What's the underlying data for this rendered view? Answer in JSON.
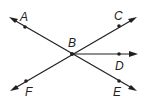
{
  "diagram": {
    "type": "geometry-rays",
    "vertex": {
      "name": "B",
      "label": "B",
      "x": 72,
      "y": 54
    },
    "points": [
      {
        "name": "A",
        "label": "A",
        "x": 25,
        "y": 27,
        "label_x": 21,
        "label_y": 21
      },
      {
        "name": "C",
        "label": "C",
        "x": 119,
        "y": 26,
        "label_x": 115,
        "label_y": 20
      },
      {
        "name": "D",
        "label": "D",
        "x": 119,
        "y": 54,
        "label_x": 115,
        "label_y": 70
      },
      {
        "name": "E",
        "label": "E",
        "x": 119,
        "y": 81,
        "label_x": 113,
        "label_y": 96
      },
      {
        "name": "F",
        "label": "F",
        "x": 26,
        "y": 81,
        "label_x": 25,
        "label_y": 96
      }
    ],
    "lines": [
      {
        "name": "line-AE",
        "through": [
          "A",
          "B",
          "E"
        ],
        "from": [
          9,
          17
        ],
        "to": [
          137,
          91
        ],
        "arrows": "both"
      },
      {
        "name": "line-FC",
        "through": [
          "F",
          "B",
          "C"
        ],
        "from": [
          10,
          91
        ],
        "to": [
          137,
          17
        ],
        "arrows": "both"
      },
      {
        "name": "ray-BD",
        "through": [
          "B",
          "D"
        ],
        "from": [
          72,
          54
        ],
        "to": [
          137,
          54
        ],
        "arrows": "end"
      }
    ],
    "color": "#231f20"
  }
}
